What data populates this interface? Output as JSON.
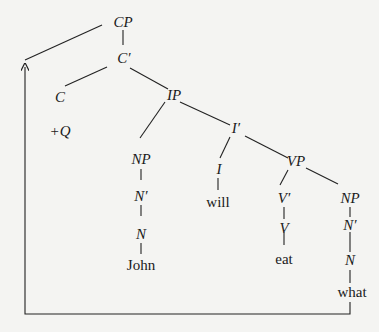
{
  "diagram": {
    "type": "syntax-tree",
    "nodes": {
      "CP": "CP",
      "Cbar": "C′",
      "C": "C",
      "plusQ": "+Q",
      "IP": "IP",
      "NP_subj": "NP",
      "Nbar_subj": "N′",
      "N_subj": "N",
      "John": "John",
      "Ibar": "I′",
      "I": "I",
      "will": "will",
      "VP": "VP",
      "Vbar": "V′",
      "V": "V",
      "eat": "eat",
      "NP_obj": "NP",
      "Nbar_obj": "N′",
      "N_obj": "N",
      "what": "what"
    },
    "edges": [
      [
        "CP",
        "Cbar"
      ],
      [
        "Cbar",
        "C"
      ],
      [
        "Cbar",
        "IP"
      ],
      [
        "IP",
        "NP_subj"
      ],
      [
        "IP",
        "Ibar"
      ],
      [
        "NP_subj",
        "Nbar_subj"
      ],
      [
        "Nbar_subj",
        "N_subj"
      ],
      [
        "N_subj",
        "John"
      ],
      [
        "Ibar",
        "I"
      ],
      [
        "Ibar",
        "VP"
      ],
      [
        "I",
        "will"
      ],
      [
        "VP",
        "Vbar"
      ],
      [
        "VP",
        "NP_obj"
      ],
      [
        "Vbar",
        "V"
      ],
      [
        "V",
        "eat"
      ],
      [
        "NP_obj",
        "Nbar_obj"
      ],
      [
        "Nbar_obj",
        "N_obj"
      ],
      [
        "N_obj",
        "what"
      ]
    ],
    "movement_arrow": {
      "from": "what",
      "to": "Spec-CP"
    }
  }
}
